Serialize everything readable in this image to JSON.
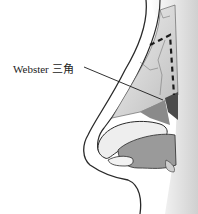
{
  "figure": {
    "annotation": {
      "label": "Webster 三角",
      "target": "webster-triangle"
    },
    "colors": {
      "outline": "#2a2a2a",
      "skin": "#ffffff",
      "cartilage": "#e6e6e6",
      "shadow": "#8a8a8a",
      "dark": "#4a4a4a"
    }
  }
}
